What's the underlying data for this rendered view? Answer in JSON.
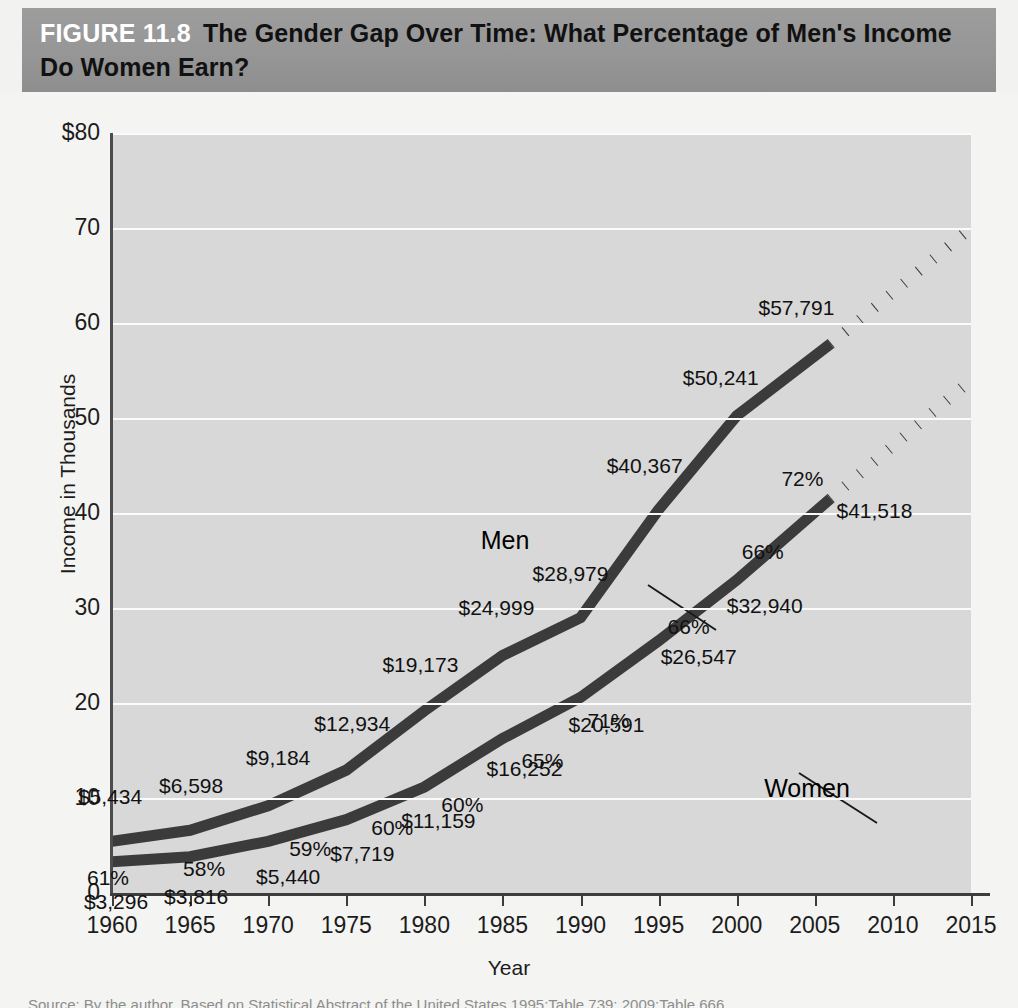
{
  "header": {
    "figure_number": "FIGURE 11.8",
    "title": "The Gender Gap Over Time: What Percentage of Men's Income Do Women Earn?"
  },
  "source_note": "Source: By the author. Based on Statistical Abstract of the United States 1995:Table 739; 2009:Table 666.",
  "chart_data": {
    "type": "line",
    "title": "The Gender Gap Over Time: What Percentage of Men's Income Do Women Earn?",
    "xlabel": "Year",
    "ylabel": "Income in Thousands",
    "xlim": [
      1960,
      2015
    ],
    "ylim": [
      0,
      80
    ],
    "grid": true,
    "legend_position": "inline-annotation",
    "x_ticks": [
      "1960",
      "1965",
      "1970",
      "1975",
      "1980",
      "1985",
      "1990",
      "1995",
      "2000",
      "2005",
      "2010",
      "2015"
    ],
    "y_ticks": [
      "$80",
      "70",
      "60",
      "50",
      "40",
      "30",
      "20",
      "10",
      "0"
    ],
    "x": [
      1960,
      1965,
      1970,
      1975,
      1980,
      1985,
      1990,
      1995,
      2000,
      2006
    ],
    "series": [
      {
        "name": "Men",
        "values": [
          5434,
          6598,
          9184,
          12934,
          19173,
          24999,
          28979,
          40367,
          50241,
          57791
        ],
        "labels": [
          "$5,434",
          "$6,598",
          "$9,184",
          "$12,934",
          "$19,173",
          "$24,999",
          "$28,979",
          "$40,367",
          "$50,241",
          "$57,791"
        ],
        "projection": {
          "from_x": 2006,
          "from_y": 57791,
          "to_x": 2015,
          "to_y": 70000,
          "style": "dotted"
        }
      },
      {
        "name": "Women",
        "values": [
          3296,
          3816,
          5440,
          7719,
          11159,
          16252,
          20591,
          26547,
          32940,
          41518
        ],
        "labels": [
          "$3,296",
          "$3,816",
          "$5,440",
          "$7,719",
          "$11,159",
          "$16,252",
          "$20,591",
          "$26,547",
          "$32,940",
          "$41,518"
        ],
        "projection": {
          "from_x": 2006,
          "from_y": 41518,
          "to_x": 2015,
          "to_y": 54000,
          "style": "dotted"
        }
      }
    ],
    "ratio_labels": [
      "61%",
      "58%",
      "59%",
      "60%",
      "60%",
      "65%",
      "71%",
      "66%",
      "66%",
      "72%"
    ],
    "ratio_values": [
      61,
      58,
      59,
      60,
      60,
      65,
      71,
      66,
      66,
      72
    ]
  },
  "annotations": {
    "men_label": "Men",
    "women_label": "Women"
  },
  "colors": {
    "banner": "#969696",
    "plot_background": "#d8d8d8",
    "gridline": "#fbfbfb",
    "series_line": "#3b3b3b",
    "axis": "#3d3d3d",
    "figure_number_text": "#ffffff",
    "title_text": "#111111"
  }
}
